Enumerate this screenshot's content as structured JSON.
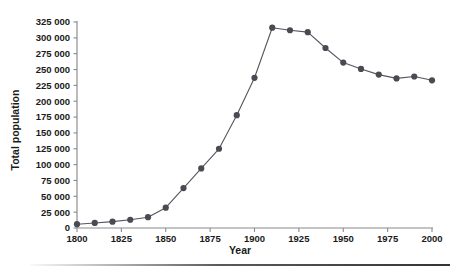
{
  "chart_data": {
    "type": "line",
    "title": "",
    "subtitle": "",
    "xlabel": "Year",
    "ylabel": "Total population",
    "xlim": [
      1800,
      2000
    ],
    "ylim": [
      0,
      325000
    ],
    "grid": false,
    "legend_position": "none",
    "x_ticks": [
      1800,
      1825,
      1850,
      1875,
      1900,
      1925,
      1950,
      1975,
      2000
    ],
    "x_tick_labels": [
      "1800",
      "1825",
      "1850",
      "1875",
      "1900",
      "1925",
      "1950",
      "1975",
      "2000"
    ],
    "y_ticks": [
      0,
      25000,
      50000,
      75000,
      100000,
      125000,
      150000,
      175000,
      200000,
      225000,
      250000,
      275000,
      300000,
      325000
    ],
    "y_tick_labels": [
      "0",
      "25 000",
      "50 000",
      "75 000",
      "100 000",
      "125 000",
      "150 000",
      "175 000",
      "200 000",
      "225 000",
      "250 000",
      "275 000",
      "300 000",
      "325 000"
    ],
    "x": [
      1800,
      1810,
      1820,
      1830,
      1840,
      1850,
      1860,
      1870,
      1880,
      1890,
      1900,
      1910,
      1920,
      1930,
      1940,
      1950,
      1960,
      1970,
      1980,
      1990,
      2000
    ],
    "values": [
      6000,
      8000,
      10000,
      13000,
      17000,
      32000,
      63000,
      94000,
      125000,
      178000,
      237000,
      316000,
      312000,
      309000,
      284000,
      261000,
      251000,
      242000,
      236000,
      239000,
      233000
    ],
    "series": [
      {
        "name": "Total population",
        "color": "#4a4a52",
        "values": [
          6000,
          8000,
          10000,
          13000,
          17000,
          32000,
          63000,
          94000,
          125000,
          178000,
          237000,
          316000,
          312000,
          309000,
          284000,
          261000,
          251000,
          242000,
          236000,
          239000,
          233000
        ]
      }
    ],
    "annotations": []
  },
  "colors": {
    "marker": "#4a4a52",
    "line": "#55555d",
    "axis": "#8a8a90",
    "text": "#1a1a1a",
    "background": "#ffffff"
  }
}
